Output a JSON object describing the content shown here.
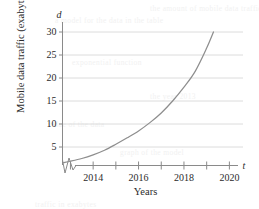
{
  "chart_data": {
    "type": "line",
    "title": "",
    "xlabel": "Years",
    "ylabel": "Mobile data traffic (exabytes)",
    "x_axis_variable": "t",
    "y_axis_variable": "d",
    "xlim": [
      2012.65,
      2020.6
    ],
    "ylim": [
      0,
      31.5
    ],
    "grid": true,
    "grid_axis": "y",
    "legend": "none",
    "x_tick_values": [
      2013,
      2014,
      2015,
      2016,
      2017,
      2018,
      2019,
      2020
    ],
    "x_tick_labels": [
      "",
      "2014",
      "",
      "2016",
      "",
      "2018",
      "",
      "2020"
    ],
    "y_tick_values": [
      5,
      10,
      15,
      20,
      25,
      30
    ],
    "y_tick_labels": [
      "5",
      "10",
      "15",
      "20",
      "25",
      "30"
    ],
    "axis_break": true,
    "axis_break_note": "zigzag break on x-axis near origin",
    "series": [
      {
        "name": "Mobile data traffic",
        "x": [
          2012.7,
          2013.0,
          2013.5,
          2014.0,
          2014.5,
          2015.0,
          2015.5,
          2016.0,
          2016.5,
          2017.0,
          2017.5,
          2018.0,
          2018.5,
          2019.0,
          2019.3
        ],
        "values": [
          1.6,
          1.9,
          2.5,
          3.3,
          4.3,
          5.6,
          7.0,
          8.5,
          10.3,
          12.4,
          15.0,
          18.0,
          21.5,
          26.5,
          30.0
        ]
      }
    ]
  },
  "colors": {
    "curve": "#8e8e8e",
    "grid": "#d8d8d8",
    "axis": "#8a8a8a",
    "text": "#2b2b2b"
  },
  "background_artifacts": [
    {
      "text": "the amount of mobile data traffic",
      "x": 150,
      "y": 4
    },
    {
      "text": "a model for the data in the table",
      "x": 55,
      "y": 16
    },
    {
      "text": "exponential function",
      "x": 72,
      "y": 58
    },
    {
      "text": "the year 2013",
      "x": 150,
      "y": 92
    },
    {
      "text": "value of the data",
      "x": 48,
      "y": 120
    },
    {
      "text": "graph of the model",
      "x": 120,
      "y": 148
    },
    {
      "text": "traffic in exabytes",
      "x": 35,
      "y": 200
    }
  ]
}
